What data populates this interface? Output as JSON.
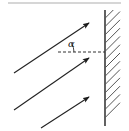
{
  "figure": {
    "type": "physics-ray-diagram",
    "angle_label": "α",
    "colors": {
      "ray": "#222222",
      "wall_line": "#3a3a3a",
      "hatch": "#555555",
      "dashed_line": "#333333",
      "top_rule": "#c8c8c8",
      "background": "#ffffff"
    },
    "top_rule": {
      "name": "top-divider-rule",
      "x1": 8,
      "y1": 3,
      "x2": 121,
      "y2": 3
    },
    "wall": {
      "name": "hatched-wall",
      "x": 105,
      "y_top": 10,
      "y_bottom": 126,
      "thickness": 15,
      "hatch_count": 14
    },
    "dashed_line": {
      "name": "reference-dashed-line",
      "x1": 58,
      "y1": 52,
      "x2": 105,
      "y2": 52,
      "dash": "3 2"
    },
    "angle_arc": {
      "name": "angle-arc",
      "cx": 58,
      "cy": 52,
      "radius": 16,
      "start_deg": 0,
      "end_deg": 33
    },
    "angle_label_pos": {
      "x": 68,
      "y": 39
    },
    "rays": [
      {
        "name": "ray-1",
        "x1": 14,
        "y1": 73,
        "x2": 89,
        "y2": 23,
        "label": "upper ray"
      },
      {
        "name": "ray-2",
        "x1": 14,
        "y1": 110,
        "x2": 89,
        "y2": 58,
        "label": "middle ray"
      },
      {
        "name": "ray-3",
        "x1": 41,
        "y1": 128,
        "x2": 89,
        "y2": 97,
        "label": "lower ray"
      }
    ],
    "arrow_head": {
      "name": "ray-arrowhead",
      "length": 7,
      "width": 4
    }
  }
}
